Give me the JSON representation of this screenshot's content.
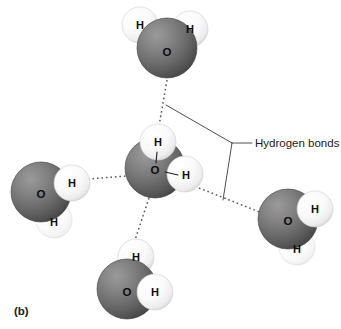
{
  "figure": {
    "panel_label": "(b)",
    "callout_label": "Hydrogen bonds",
    "background_color": "#ffffff",
    "oxygen_color": "#6e6e6e",
    "oxygen_dark_color": "#4a4a4a",
    "hydrogen_color": "#fbfbfb",
    "hydrogen_shade_color": "#d8d8d8",
    "hbond_color": "#555555",
    "leader_color": "#3a3a3a",
    "label_color": "#0d0d0d"
  },
  "molecules": [
    {
      "id": "water-top",
      "position": "top",
      "oxygen": {
        "label": "O",
        "cx": 167,
        "cy": 48,
        "r": 30
      },
      "hydrogens": [
        {
          "label": "H",
          "cx": 140,
          "cy": 25,
          "r": 18
        },
        {
          "label": "H",
          "cx": 190,
          "cy": 29,
          "r": 18
        }
      ]
    },
    {
      "id": "water-center",
      "position": "center",
      "oxygen": {
        "label": "O",
        "cx": 155,
        "cy": 168,
        "r": 30
      },
      "hydrogens": [
        {
          "label": "H",
          "cx": 158,
          "cy": 142,
          "r": 18
        },
        {
          "label": "H",
          "cx": 185,
          "cy": 174,
          "r": 18
        }
      ]
    },
    {
      "id": "water-left",
      "position": "left",
      "oxygen": {
        "label": "O",
        "cx": 41,
        "cy": 192,
        "r": 30
      },
      "hydrogens": [
        {
          "label": "H",
          "cx": 72,
          "cy": 183,
          "r": 18
        },
        {
          "label": "H",
          "cx": 54,
          "cy": 220,
          "r": 18
        }
      ]
    },
    {
      "id": "water-right",
      "position": "right",
      "oxygen": {
        "label": "O",
        "cx": 288,
        "cy": 219,
        "r": 30
      },
      "hydrogens": [
        {
          "label": "H",
          "cx": 315,
          "cy": 209,
          "r": 18
        },
        {
          "label": "H",
          "cx": 297,
          "cy": 247,
          "r": 18
        }
      ]
    },
    {
      "id": "water-bottom",
      "position": "bottom",
      "oxygen": {
        "label": "O",
        "cx": 127,
        "cy": 289,
        "r": 30
      },
      "hydrogens": [
        {
          "label": "H",
          "cx": 136,
          "cy": 257,
          "r": 18
        },
        {
          "label": "H",
          "cx": 155,
          "cy": 292,
          "r": 18
        }
      ]
    }
  ],
  "hydrogen_bonds": [
    {
      "id": "hbond-top",
      "x1": 167,
      "y1": 80,
      "x2": 159,
      "y2": 126
    },
    {
      "id": "hbond-left",
      "x1": 88,
      "y1": 179,
      "x2": 127,
      "y2": 176
    },
    {
      "id": "hbond-right",
      "x1": 199,
      "y1": 188,
      "x2": 262,
      "y2": 213
    },
    {
      "id": "hbond-bottom",
      "x1": 149,
      "y1": 198,
      "x2": 134,
      "y2": 243
    }
  ],
  "covalent_bonds": [
    {
      "id": "covalent-center-top",
      "x1": 157,
      "y1": 152,
      "x2": 156,
      "y2": 163
    },
    {
      "id": "covalent-center-right",
      "x1": 165,
      "y1": 172,
      "x2": 178,
      "y2": 175
    }
  ],
  "callout": {
    "apex_x": 232,
    "apex_y": 143,
    "branch_top": {
      "x": 166,
      "y": 105
    },
    "branch_bottom": {
      "x": 223,
      "y": 200
    },
    "stem": {
      "x1": 232,
      "y1": 143,
      "x2": 252,
      "y2": 143
    },
    "text_x": 255,
    "text_y": 143
  }
}
